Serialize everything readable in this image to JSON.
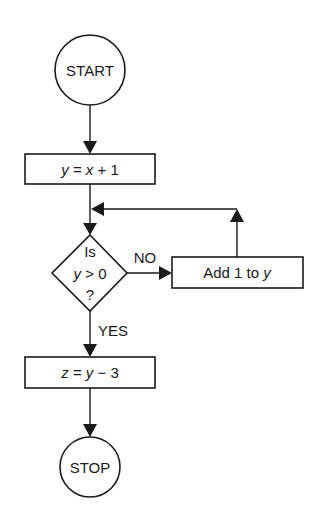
{
  "diagram": {
    "type": "flowchart",
    "colors": {
      "ink": "#1a1a1a",
      "background": "#ffffff"
    },
    "nodes": {
      "start": {
        "shape": "circle",
        "label": "START"
      },
      "assign_y": {
        "shape": "process",
        "var": "y",
        "eq": " = ",
        "expr_var": "x",
        "expr_rest": " + 1",
        "label": "y = x + 1"
      },
      "decision": {
        "shape": "diamond",
        "line1": "Is",
        "line2_var": "y",
        "line2_rest": " > 0",
        "line3": "?",
        "label": "Is y > 0 ?"
      },
      "increment": {
        "shape": "process",
        "text": "Add 1 to ",
        "var": "y",
        "label": "Add 1 to y"
      },
      "assign_z": {
        "shape": "process",
        "var": "z",
        "eq": " = ",
        "expr_var": "y",
        "expr_rest": " − 3",
        "label": "z = y − 3"
      },
      "stop": {
        "shape": "circle",
        "label": "STOP"
      }
    },
    "edges": {
      "no_label": "NO",
      "yes_label": "YES"
    },
    "edge_list": [
      {
        "from": "start",
        "to": "assign_y"
      },
      {
        "from": "assign_y",
        "to": "decision"
      },
      {
        "from": "decision",
        "to": "increment",
        "label": "NO"
      },
      {
        "from": "increment",
        "to": "decision",
        "note": "loop back"
      },
      {
        "from": "decision",
        "to": "assign_z",
        "label": "YES"
      },
      {
        "from": "assign_z",
        "to": "stop"
      }
    ]
  }
}
